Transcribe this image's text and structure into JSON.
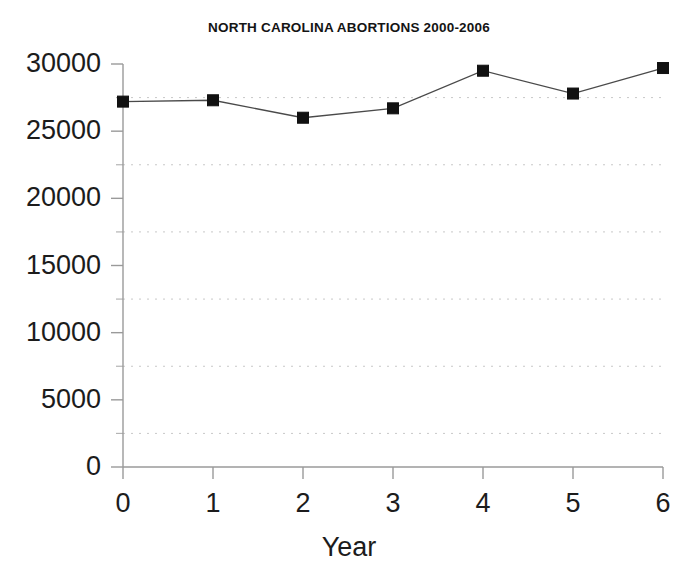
{
  "chart_data": {
    "type": "line",
    "title": "NORTH CAROLINA ABORTIONS 2000-2006",
    "xlabel": "Year",
    "ylabel": "",
    "x": [
      0,
      1,
      2,
      3,
      4,
      5,
      6
    ],
    "values": [
      27200,
      27300,
      26000,
      26700,
      29500,
      27800,
      29700
    ],
    "series": [
      {
        "name": "Abortions",
        "values": [
          27200,
          27300,
          26000,
          26700,
          29500,
          27800,
          29700
        ]
      }
    ],
    "xlim": [
      0,
      6
    ],
    "ylim": [
      0,
      30000
    ],
    "y_ticks": [
      0,
      5000,
      10000,
      15000,
      20000,
      25000,
      30000
    ],
    "y_tick_labels": [
      "0",
      "5000",
      "10000",
      "15000",
      "20000",
      "25000",
      "30000"
    ],
    "y_minor_ticks": [
      2500,
      7500,
      12500,
      17500,
      22500,
      27500
    ],
    "x_ticks": [
      0,
      1,
      2,
      3,
      4,
      5,
      6
    ],
    "x_tick_labels": [
      "0",
      "1",
      "2",
      "3",
      "4",
      "5",
      "6"
    ],
    "grid": true,
    "grid_style": "dotted",
    "grid_at": "minor",
    "legend": false,
    "marker": "square",
    "line_color": "#4a4a4a",
    "marker_color": "#111111",
    "background_color": "#ffffff"
  },
  "axis": {
    "y_title": "",
    "x_title": "Year"
  }
}
